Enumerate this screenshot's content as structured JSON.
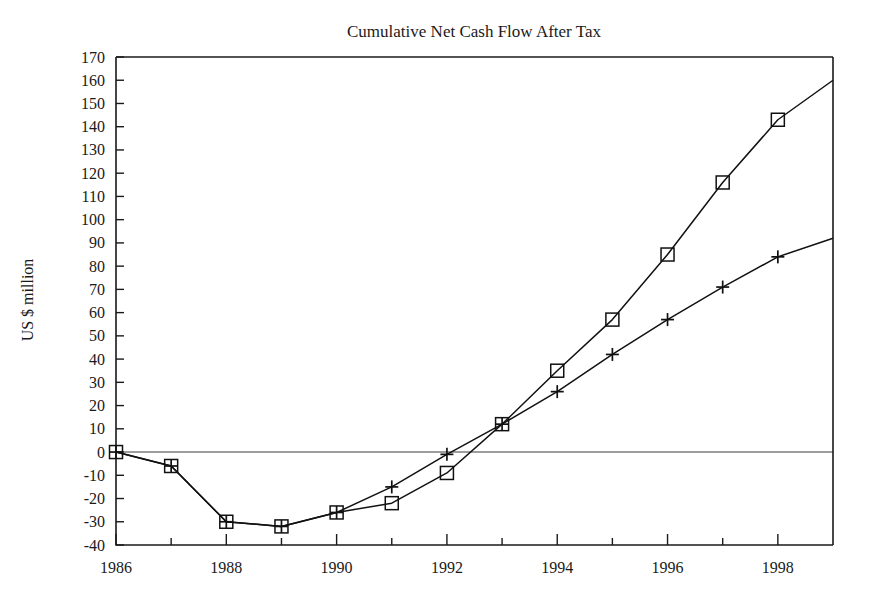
{
  "chart_data": {
    "type": "line",
    "title": "Cumulative Net Cash Flow After Tax",
    "xlabel": "",
    "ylabel": "US $ million",
    "x": [
      1986,
      1987,
      1988,
      1989,
      1990,
      1991,
      1992,
      1993,
      1994,
      1995,
      1996,
      1997,
      1998,
      1999
    ],
    "xlim": [
      1986,
      1999
    ],
    "ylim": [
      -40,
      170
    ],
    "x_tick_labels": [
      "1986",
      "1988",
      "1990",
      "1992",
      "1994",
      "1996",
      "1998"
    ],
    "x_tick_values": [
      1986,
      1988,
      1990,
      1992,
      1994,
      1996,
      1998
    ],
    "x_minor_tick_values": [
      1987,
      1989,
      1991,
      1993,
      1995,
      1997
    ],
    "y_tick_labels": [
      "170",
      "160",
      "150",
      "140",
      "130",
      "120",
      "110",
      "100",
      "90",
      "80",
      "70",
      "60",
      "50",
      "40",
      "30",
      "20",
      "10",
      "0",
      "-10",
      "-20",
      "-30",
      "-40"
    ],
    "y_tick_values": [
      170,
      160,
      150,
      140,
      130,
      120,
      110,
      100,
      90,
      80,
      70,
      60,
      50,
      40,
      30,
      20,
      10,
      0,
      -10,
      -20,
      -30,
      -40
    ],
    "grid": false,
    "zero_line": true,
    "legend": null,
    "series": [
      {
        "name": "series-square",
        "marker": "square",
        "values": [
          0,
          -6,
          -30,
          -32,
          -26,
          -22,
          -9,
          12,
          35,
          57,
          85,
          116,
          143,
          160
        ]
      },
      {
        "name": "series-plus",
        "marker": "plus",
        "values": [
          0,
          -6,
          -30,
          -32,
          -26,
          -15,
          -1,
          12,
          26,
          42,
          57,
          71,
          84,
          92
        ]
      }
    ],
    "marker_x": [
      1986,
      1987,
      1988,
      1989,
      1990,
      1991,
      1992,
      1993,
      1994,
      1995,
      1996,
      1997,
      1998
    ],
    "colors": {
      "background": "#ffffff",
      "line": "#111111",
      "axis": "#1a1a1a",
      "text": "#1a1a1a"
    }
  }
}
